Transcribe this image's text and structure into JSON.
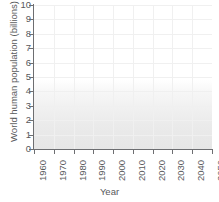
{
  "chart_data": {
    "type": "line",
    "title": "",
    "xlabel": "Year",
    "ylabel": "World human population (billions)",
    "xlim": [
      1960,
      2050
    ],
    "ylim": [
      0,
      10
    ],
    "grid": true,
    "legend": "none",
    "line_color": "#808285",
    "x_tick_labels": [
      "1960",
      "1970",
      "1980",
      "1990",
      "2000",
      "2010",
      "2020",
      "2030",
      "2040",
      "2050"
    ],
    "y_tick_labels": [
      "10",
      "9",
      "8",
      "7",
      "6",
      "5",
      "4",
      "3",
      "2",
      "1",
      "0"
    ],
    "x": [
      1960,
      1970,
      1980,
      1990,
      2000,
      2010,
      2020,
      2030,
      2040,
      2050
    ],
    "series": [
      {
        "name": "World human population",
        "values": [
          3.0,
          3.7,
          4.45,
          5.4,
          6.1,
          6.9,
          7.7,
          8.4,
          9.0,
          9.5
        ]
      }
    ]
  },
  "axes": {
    "y_title": "World human population (billions)",
    "x_title": "Year"
  },
  "caption": {
    "cut_text": ""
  }
}
